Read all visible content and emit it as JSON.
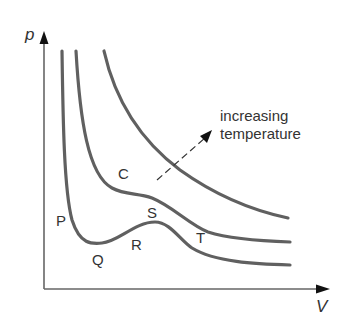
{
  "diagram": {
    "axes": {
      "y_label": "p",
      "x_label": "V"
    },
    "point_labels": {
      "P": "P",
      "Q": "Q",
      "R": "R",
      "S": "S",
      "T": "T",
      "C": "C"
    },
    "annotation": {
      "line1": "increasing",
      "line2": "temperature"
    },
    "colors": {
      "curve": "#606060",
      "axis": "#555555",
      "text": "#333333"
    },
    "curves": [
      {
        "name": "below-critical isotherm",
        "labels": [
          "P",
          "Q",
          "R",
          "S",
          "T"
        ]
      },
      {
        "name": "critical isotherm",
        "labels": [
          "C"
        ]
      },
      {
        "name": "above-critical isotherm",
        "labels": []
      }
    ]
  }
}
